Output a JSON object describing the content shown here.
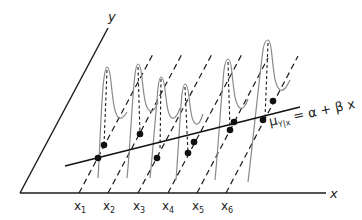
{
  "axes": {
    "x_label": "x",
    "y_label": "y"
  },
  "ticks": [
    {
      "label": "x",
      "sub": "1"
    },
    {
      "label": "x",
      "sub": "2"
    },
    {
      "label": "x",
      "sub": "3"
    },
    {
      "label": "x",
      "sub": "4"
    },
    {
      "label": "x",
      "sub": "5"
    },
    {
      "label": "x",
      "sub": "6"
    }
  ],
  "regression": {
    "mu": "μ",
    "subscript": "Y|x",
    "rhs": " = α + β x"
  },
  "colors": {
    "axis": "#1a1a1a",
    "curve": "#8a8a8a",
    "point": "#111111"
  }
}
